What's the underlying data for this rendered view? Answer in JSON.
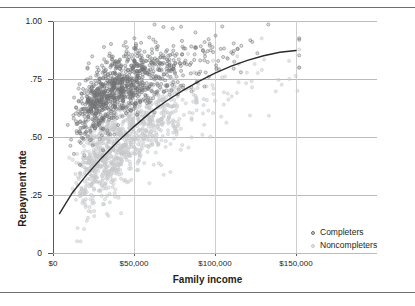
{
  "figure": {
    "top_rule": true,
    "bottom_rule": true
  },
  "chart_data": {
    "type": "scatter",
    "title": "",
    "xlabel": "Family income",
    "ylabel": "Repayment rate",
    "xlim": [
      0,
      200000
    ],
    "ylim": [
      0,
      1.0
    ],
    "grid": "horizontal-and-vertical",
    "xticks": [
      0,
      50000,
      100000,
      150000
    ],
    "xticklabels": [
      "$0",
      "$50,000",
      "$100,000",
      "$150,000"
    ],
    "yticks": [
      0,
      0.25,
      0.5,
      0.75,
      1.0
    ],
    "yticklabels": [
      "0",
      ".25",
      ".50",
      ".75",
      "1.00"
    ],
    "legend_position": "lower-right-inside",
    "series": [
      {
        "name": "Completers",
        "marker": "open-circle",
        "color": "#7a7c7e",
        "n_points": 1000,
        "description": "Upper point cloud; repayment rate rises from about .45 at low family income toward .95 at high family income",
        "x_range": [
          8000,
          150000
        ],
        "y_range": [
          0.36,
          0.98
        ]
      },
      {
        "name": "Noncompleters",
        "marker": "open-circle",
        "color": "#cdcfd1",
        "n_points": 1000,
        "description": "Lower point cloud; repayment rate rises from about .15 at low family income toward .75 at high family income",
        "x_range": [
          8000,
          150000
        ],
        "y_range": [
          0.08,
          0.8
        ]
      }
    ],
    "trend_line": {
      "name": "fitted curve",
      "color": "#2b2b2b",
      "points": [
        [
          4000,
          0.17
        ],
        [
          12000,
          0.26
        ],
        [
          20000,
          0.33
        ],
        [
          30000,
          0.41
        ],
        [
          40000,
          0.48
        ],
        [
          50000,
          0.545
        ],
        [
          60000,
          0.605
        ],
        [
          70000,
          0.655
        ],
        [
          80000,
          0.7
        ],
        [
          90000,
          0.74
        ],
        [
          100000,
          0.775
        ],
        [
          110000,
          0.805
        ],
        [
          120000,
          0.83
        ],
        [
          130000,
          0.85
        ],
        [
          140000,
          0.865
        ],
        [
          150000,
          0.873
        ]
      ]
    }
  },
  "legend": {
    "items": [
      {
        "label": "Completers"
      },
      {
        "label": "Noncompleters"
      }
    ]
  }
}
